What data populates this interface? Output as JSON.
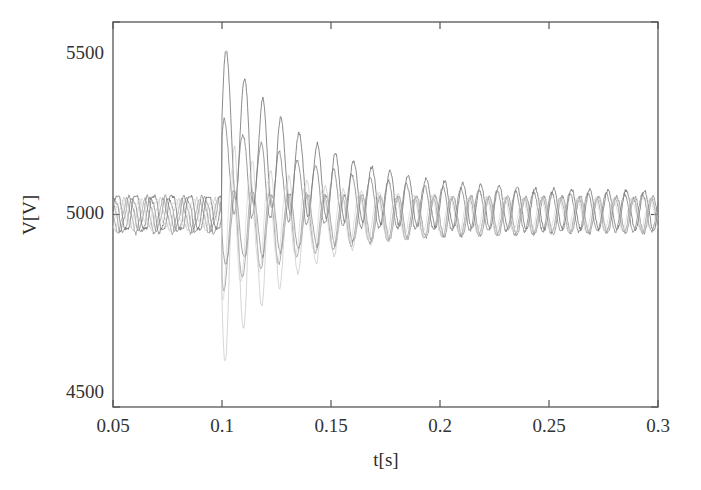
{
  "chart_data": {
    "type": "line",
    "title": "",
    "subtitle": "",
    "xlabel": "t[s]",
    "ylabel": "V[V]",
    "xlim": [
      0.05,
      0.3
    ],
    "ylim": [
      4500,
      5500
    ],
    "xticks": [
      0.05,
      0.1,
      0.15,
      0.2,
      0.25,
      0.3
    ],
    "xtick_labels": [
      "0.05",
      "0.1",
      "0.15",
      "0.2",
      "0.25",
      "0.3"
    ],
    "yticks": [
      4500,
      5000,
      5500
    ],
    "ytick_labels": [
      "4500",
      "5000",
      "5500"
    ],
    "grid": false,
    "legend": null,
    "legend_position": "none",
    "frame": "box",
    "event_time": 0.1,
    "event_note": "step disturbance at t = 0.1 s followed by damped oscillations",
    "oscillation_frequency_hz": 120,
    "sample_step": 0.00025,
    "line_color": "#6e6e6e",
    "faint_line_color": "#b9b9b9",
    "axis_color": "#555555",
    "background_color": "#ffffff",
    "series": [
      {
        "name": "trace-1",
        "color": "#707070",
        "opacity": 0.95,
        "pre_mean": 5005,
        "pre_amp": 48,
        "pre_phase": 0.0,
        "step_level": 5255,
        "post_amp": 195,
        "post_phase": 0.0,
        "decay_tau": 0.038,
        "final_mean": 5010,
        "final_amp": 50,
        "peak_after_fault": 5447
      },
      {
        "name": "trace-2",
        "color": "#7a7a7a",
        "opacity": 0.9,
        "pre_mean": 4998,
        "pre_amp": 45,
        "pre_phase": 1.05,
        "step_level": 5130,
        "post_amp": 120,
        "post_phase": 0.6,
        "decay_tau": 0.045,
        "final_mean": 5002,
        "final_amp": 48,
        "peak_after_fault": 5255
      },
      {
        "name": "trace-3",
        "color": "#848484",
        "opacity": 0.88,
        "pre_mean": 5002,
        "pre_amp": 42,
        "pre_phase": 2.1,
        "step_level": 4962,
        "post_amp": 95,
        "post_phase": 3.3,
        "decay_tau": 0.05,
        "final_mean": 5000,
        "final_amp": 46,
        "peak_after_fault": 5060
      },
      {
        "name": "trace-4",
        "color": "#8e8e8e",
        "opacity": 0.85,
        "pre_mean": 4996,
        "pre_amp": 40,
        "pre_phase": 3.05,
        "step_level": 4935,
        "post_amp": 130,
        "post_phase": 3.9,
        "decay_tau": 0.042,
        "final_mean": 4998,
        "final_amp": 44,
        "peak_after_fault": 5050
      },
      {
        "name": "trace-5",
        "color": "#c2c2c2",
        "opacity": 0.8,
        "pre_mean": 5000,
        "pre_amp": 38,
        "pre_phase": 4.2,
        "step_level": 4900,
        "post_amp": 300,
        "post_phase": 3.55,
        "decay_tau": 0.03,
        "final_mean": 5000,
        "final_amp": 42,
        "peak_after_fault": 4582
      },
      {
        "name": "trace-6",
        "color": "#cfcfcf",
        "opacity": 0.75,
        "pre_mean": 5003,
        "pre_amp": 36,
        "pre_phase": 5.3,
        "step_level": 4955,
        "post_amp": 175,
        "post_phase": 4.4,
        "decay_tau": 0.034,
        "final_mean": 5001,
        "final_amp": 40,
        "peak_after_fault": 4760
      }
    ]
  },
  "axes": {
    "x_title": "t[s]",
    "y_title": "V[V]",
    "x_tick_0": "0.05",
    "x_tick_1": "0.1",
    "x_tick_2": "0.15",
    "x_tick_3": "0.2",
    "x_tick_4": "0.25",
    "x_tick_5": "0.3",
    "y_tick_0": "4500",
    "y_tick_1": "5000",
    "y_tick_2": "5500"
  }
}
